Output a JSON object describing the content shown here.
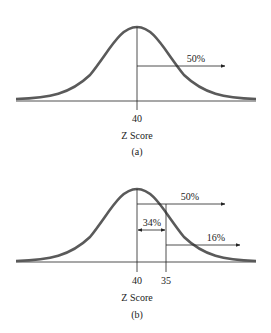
{
  "figure": {
    "panel_a": {
      "caption": "(a)",
      "axis_label": "Z Score",
      "ticks": [
        {
          "label": "40",
          "x": 137
        }
      ],
      "arrows": [
        {
          "label": "50%",
          "type": "right-arrow",
          "from_x": 137,
          "to_x": 225,
          "y": 66
        }
      ]
    },
    "panel_b": {
      "caption": "(b)",
      "axis_label": "Z Score",
      "ticks": [
        {
          "label": "40",
          "x": 137
        },
        {
          "label": "35",
          "x": 166
        }
      ],
      "arrows": [
        {
          "label": "50%",
          "type": "right-arrow",
          "from_x": 137,
          "to_x": 225,
          "y": 204
        },
        {
          "label": "34%",
          "type": "double-arrow",
          "from_x": 137,
          "to_x": 166,
          "y": 230
        },
        {
          "label": "16%",
          "type": "right-arrow",
          "from_x": 166,
          "to_x": 240,
          "y": 245
        }
      ]
    },
    "colors": {
      "curve": "#5a5a5a",
      "baseline": "#8a8a8a",
      "text": "#222222"
    }
  }
}
